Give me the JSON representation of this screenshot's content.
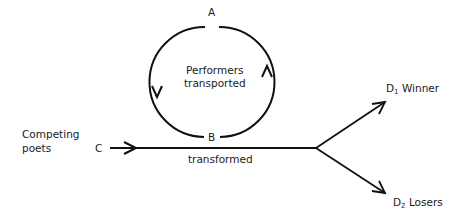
{
  "diagram": {
    "nodes": {
      "A": "A",
      "B": "B",
      "C": "C",
      "D1": {
        "letter": "D",
        "sub": "1",
        "label": "Winner"
      },
      "D2": {
        "letter": "D",
        "sub": "2",
        "label": "Losers"
      }
    },
    "labels": {
      "cycle_line1": "Performers",
      "cycle_line2": "transported",
      "input_line1": "Competing",
      "input_line2": "poets",
      "edge_transformed": "transformed"
    },
    "colors": {
      "line": "#111111",
      "text": "#1a1a1a",
      "background": "#ffffff"
    }
  }
}
